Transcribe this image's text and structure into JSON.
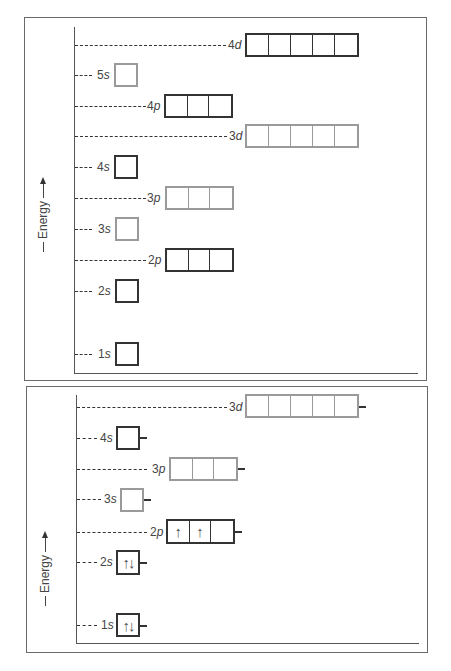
{
  "axis_label": "Energy",
  "top_panel": {
    "title": "",
    "orbitals": [
      {
        "id": "4d",
        "n": "4",
        "l": "d",
        "boxes": 5,
        "shade": "dark",
        "electrons": []
      },
      {
        "id": "5s",
        "n": "5",
        "l": "s",
        "boxes": 1,
        "shade": "light",
        "electrons": []
      },
      {
        "id": "4p",
        "n": "4",
        "l": "p",
        "boxes": 3,
        "shade": "dark",
        "electrons": []
      },
      {
        "id": "3d",
        "n": "3",
        "l": "d",
        "boxes": 5,
        "shade": "light",
        "electrons": []
      },
      {
        "id": "4s",
        "n": "4",
        "l": "s",
        "boxes": 1,
        "shade": "dark",
        "electrons": []
      },
      {
        "id": "3p",
        "n": "3",
        "l": "p",
        "boxes": 3,
        "shade": "light",
        "electrons": []
      },
      {
        "id": "3s",
        "n": "3",
        "l": "s",
        "boxes": 1,
        "shade": "light",
        "electrons": []
      },
      {
        "id": "2p",
        "n": "2",
        "l": "p",
        "boxes": 3,
        "shade": "dark",
        "electrons": []
      },
      {
        "id": "2s",
        "n": "2",
        "l": "s",
        "boxes": 1,
        "shade": "dark",
        "electrons": []
      },
      {
        "id": "1s",
        "n": "1",
        "l": "s",
        "boxes": 1,
        "shade": "dark",
        "electrons": []
      }
    ]
  },
  "bottom_panel": {
    "orbitals": [
      {
        "id": "3d",
        "n": "3",
        "l": "d",
        "boxes": 5,
        "shade": "light",
        "electrons": [
          "",
          "",
          "",
          "",
          ""
        ]
      },
      {
        "id": "4s",
        "n": "4",
        "l": "s",
        "boxes": 1,
        "shade": "dark",
        "electrons": [
          ""
        ]
      },
      {
        "id": "3p",
        "n": "3",
        "l": "p",
        "boxes": 3,
        "shade": "light",
        "electrons": [
          "",
          "",
          ""
        ]
      },
      {
        "id": "3s",
        "n": "3",
        "l": "s",
        "boxes": 1,
        "shade": "light",
        "electrons": [
          ""
        ]
      },
      {
        "id": "2p",
        "n": "2",
        "l": "p",
        "boxes": 3,
        "shade": "dark",
        "electrons": [
          "↑",
          "↑",
          ""
        ]
      },
      {
        "id": "2s",
        "n": "2",
        "l": "s",
        "boxes": 1,
        "shade": "dark",
        "electrons": [
          "↑↓"
        ]
      },
      {
        "id": "1s",
        "n": "1",
        "l": "s",
        "boxes": 1,
        "shade": "dark",
        "electrons": [
          "↑↓"
        ]
      }
    ]
  },
  "colors": {
    "dark_orbital": "#333333",
    "light_orbital": "#9a9a9a",
    "text": "#444444",
    "frame": "#6a6a6a"
  }
}
